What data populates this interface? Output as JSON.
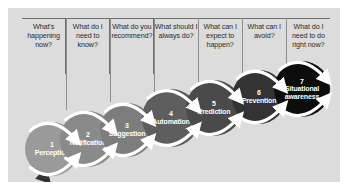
{
  "diagram": {
    "arrow_label": "Continuous learning",
    "panel_color": "#dcdcdc",
    "arrow_color": "#333333",
    "columns": [
      {
        "question": "What's happening now?"
      },
      {
        "question": "What do I need to know?"
      },
      {
        "question": "What do you recommend?"
      },
      {
        "question": "What should I always do?"
      },
      {
        "question": "What can I expect to happen?"
      },
      {
        "question": "What can I avoid?"
      },
      {
        "question": "What do I need to do right now?"
      }
    ],
    "stages": [
      {
        "number": "1",
        "name": "Perception",
        "color": "#9a9a9a"
      },
      {
        "number": "2",
        "name": "Notification",
        "color": "#8a8a8a"
      },
      {
        "number": "3",
        "name": "Suggestion",
        "color": "#7d7d7d"
      },
      {
        "number": "4",
        "name": "Automation",
        "color": "#5e5e5e"
      },
      {
        "number": "5",
        "name": "Prediction",
        "color": "#4a4a4a"
      },
      {
        "number": "6",
        "name": "Prevention",
        "color": "#333333"
      },
      {
        "number": "7",
        "name": "Situational awareness",
        "color": "#0d0d0d"
      }
    ]
  },
  "layout": {
    "circles": [
      {
        "cx": 44,
        "cy": 141,
        "r": 27
      },
      {
        "cx": 80,
        "cy": 131,
        "r": 28
      },
      {
        "cx": 119,
        "cy": 122,
        "r": 27
      },
      {
        "cx": 163,
        "cy": 110,
        "r": 29
      },
      {
        "cx": 206,
        "cy": 100,
        "r": 28
      },
      {
        "cx": 251,
        "cy": 89,
        "r": 27
      },
      {
        "cx": 294,
        "cy": 81,
        "r": 28
      }
    ]
  }
}
